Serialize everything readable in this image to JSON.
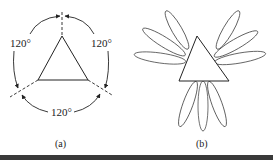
{
  "figure": {
    "panels": [
      {
        "id": "a",
        "caption": "(a)",
        "angle_labels": [
          "120°",
          "120°",
          "120°"
        ],
        "description": "Triangle with three dashed axes separated by 120° arcs"
      },
      {
        "id": "b",
        "caption": "(b)",
        "description": "Triangle with radiating elliptical petals (lobes) in three groups"
      }
    ]
  },
  "colors": {
    "stroke": "#222222",
    "background": "#ffffff",
    "bottom_bar": "#3a3a3a"
  }
}
